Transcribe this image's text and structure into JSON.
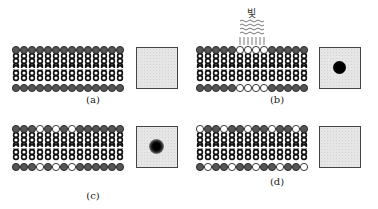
{
  "figure": {
    "panels": [
      {
        "id": "a",
        "caption": "(a)",
        "top_row": "DDDDDDDDDDDDDD",
        "bottom_row": "DDDDDDDDDDDDDD",
        "light": false,
        "square_spot": "none"
      },
      {
        "id": "b",
        "caption": "(b)",
        "top_row": "DDDDDLLLLDDDDD",
        "bottom_row": "DDDDDLLLLDDDDD",
        "light": true,
        "light_label": "빛",
        "square_spot": "solid"
      },
      {
        "id": "c",
        "caption": "(c)",
        "top_row": "DDDLDLDLDDDDDD",
        "bottom_row": "DDDLDLDLDDDDDD",
        "light": false,
        "square_spot": "blurred"
      },
      {
        "id": "d",
        "caption": "(d)",
        "top_row": "LDDLDDLDDLDDLD",
        "bottom_row": "DLDDLDDLDDLDDL",
        "light": false,
        "square_spot": "none"
      }
    ],
    "legend": {
      "dark_head": "D",
      "light_head": "L"
    },
    "colors": {
      "dark_head": "#555555",
      "light_head": "#ffffff",
      "outline": "#222222",
      "square_bg": "#e6e6e6",
      "spot": "#000000"
    }
  }
}
